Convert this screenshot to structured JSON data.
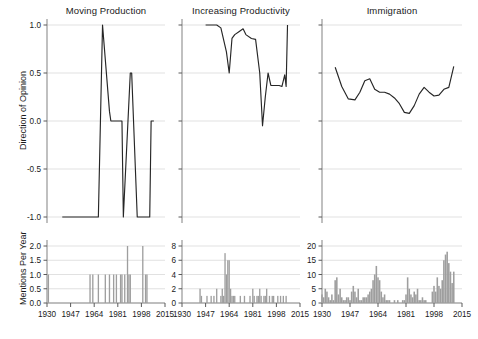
{
  "figure": {
    "panel_titles": [
      "Moving Production",
      "Increasing Productivity",
      "Immigration"
    ],
    "row_axis_labels": [
      "Direction of Opinion",
      "Mentions Per Year"
    ],
    "line_color": "#262626",
    "bar_color": "#9e9e9e",
    "grid_color": "#d9d9d9",
    "axis_color": "#8c8c8c"
  },
  "chart_data": [
    {
      "type": "line",
      "title": "Moving Production",
      "xlabel": "",
      "ylabel": "Direction of Opinion",
      "xlim": [
        1930,
        2015
      ],
      "ylim": [
        -1,
        1
      ],
      "yticks": [
        -1.0,
        -0.5,
        0.0,
        0.5,
        1.0
      ],
      "ytick_labels": [
        "-1.0",
        "-0.5",
        "0.0",
        "0.5",
        "1.0"
      ],
      "xticks": [
        1930,
        1947,
        1964,
        1981,
        1998,
        2015
      ],
      "xtick_labels": [
        "1930",
        "1947",
        "1964",
        "1981",
        "1998",
        "2015"
      ],
      "grid": true,
      "x": [
        1941,
        1950,
        1960,
        1966,
        1967,
        1970,
        1975,
        1976,
        1980,
        1983,
        1984,
        1985,
        1990,
        1991,
        1995,
        1999,
        2000,
        2004,
        2005,
        2007
      ],
      "y": [
        -1,
        -1,
        -1,
        -1,
        -1,
        1,
        0.1,
        0,
        0,
        0,
        0,
        -1,
        0.5,
        0.5,
        -1,
        -1,
        -1,
        -1,
        0,
        0
      ]
    },
    {
      "type": "line",
      "title": "Increasing Productivity",
      "xlabel": "",
      "ylabel": "Direction of Opinion",
      "xlim": [
        1930,
        2015
      ],
      "ylim": [
        -1,
        1
      ],
      "yticks": [
        -1.0,
        -0.5,
        0.0,
        0.5,
        1.0
      ],
      "ytick_labels": [
        "-1.0",
        "-0.5",
        "0.0",
        "0.5",
        "1.0"
      ],
      "xticks": [
        1930,
        1947,
        1964,
        1981,
        1998,
        2015
      ],
      "xtick_labels": [
        "1930",
        "1947",
        "1964",
        "1981",
        "1998",
        "2015"
      ],
      "grid": true,
      "x": [
        1947,
        1953,
        1955,
        1958,
        1962,
        1964,
        1966,
        1968,
        1971,
        1974,
        1976,
        1980,
        1983,
        1986,
        1988,
        1990,
        1992,
        1994,
        1997,
        2000,
        2002,
        2004,
        2005,
        2006
      ],
      "y": [
        1.0,
        1.0,
        1.0,
        0.97,
        0.72,
        0.5,
        0.86,
        0.9,
        0.93,
        0.96,
        0.9,
        0.86,
        0.85,
        0.5,
        -0.05,
        0.25,
        0.5,
        0.37,
        0.37,
        0.37,
        0.36,
        0.48,
        0.36,
        1.0
      ]
    },
    {
      "type": "line",
      "title": "Immigration",
      "xlabel": "",
      "ylabel": "Direction of Opinion",
      "xlim": [
        1930,
        2015
      ],
      "ylim": [
        -1,
        1
      ],
      "yticks": [
        -1.0,
        -0.5,
        0.0,
        0.5,
        1.0
      ],
      "ytick_labels": [
        "-1.0",
        "-0.5",
        "0.0",
        "0.5",
        "1.0"
      ],
      "xticks": [
        1930,
        1947,
        1964,
        1981,
        1998,
        2015
      ],
      "xtick_labels": [
        "1930",
        "1947",
        "1964",
        "1981",
        "1998",
        "2015"
      ],
      "grid": true,
      "x": [
        1938,
        1942,
        1946,
        1950,
        1953,
        1956,
        1959,
        1962,
        1965,
        1968,
        1971,
        1974,
        1977,
        1980,
        1983,
        1986,
        1989,
        1992,
        1995,
        1998,
        2001,
        2004,
        2007,
        2010
      ],
      "y": [
        0.56,
        0.36,
        0.23,
        0.22,
        0.3,
        0.42,
        0.44,
        0.33,
        0.3,
        0.3,
        0.28,
        0.24,
        0.18,
        0.09,
        0.08,
        0.16,
        0.28,
        0.35,
        0.3,
        0.26,
        0.27,
        0.33,
        0.35,
        0.57
      ]
    },
    {
      "type": "bar",
      "title": "",
      "xlabel": "",
      "ylabel": "Mentions Per Year",
      "xlim": [
        1930,
        2015
      ],
      "ylim": [
        0,
        2
      ],
      "yticks": [
        0.0,
        0.5,
        1.0,
        1.5,
        2.0
      ],
      "ytick_labels": [
        "0.0",
        "0.5",
        "1.0",
        "1.5",
        "2.0"
      ],
      "xticks": [
        1930,
        1947,
        1964,
        1981,
        1998,
        2015
      ],
      "xtick_labels": [
        "1930",
        "1947",
        "1964",
        "1981",
        "1998",
        "2015"
      ],
      "grid": true,
      "x": [
        1931,
        1961,
        1963,
        1967,
        1972,
        1975,
        1978,
        1980,
        1983,
        1984,
        1986,
        1988,
        1989,
        1990,
        1999,
        2001,
        2002
      ],
      "values": [
        1,
        1,
        1,
        1,
        1,
        1,
        1,
        1,
        1,
        1,
        1,
        2,
        1,
        1,
        2,
        1,
        1
      ]
    },
    {
      "type": "bar",
      "title": "",
      "xlabel": "",
      "ylabel": "Mentions Per Year",
      "xlim": [
        1930,
        2015
      ],
      "ylim": [
        0,
        8
      ],
      "yticks": [
        0,
        2,
        4,
        6,
        8
      ],
      "ytick_labels": [
        "0",
        "2",
        "4",
        "6",
        "8"
      ],
      "xticks": [
        1930,
        1947,
        1964,
        1981,
        1998,
        2015
      ],
      "xtick_labels": [
        "1930",
        "1947",
        "1964",
        "1981",
        "1998",
        "2015"
      ],
      "grid": true,
      "x": [
        1943,
        1944,
        1948,
        1951,
        1953,
        1955,
        1958,
        1959,
        1960,
        1961,
        1962,
        1963,
        1964,
        1965,
        1966,
        1967,
        1968,
        1972,
        1975,
        1979,
        1981,
        1982,
        1984,
        1985,
        1986,
        1987,
        1989,
        1990,
        1991,
        1993,
        1995,
        1996,
        1999,
        2001,
        2003,
        2005
      ],
      "values": [
        2,
        1,
        1,
        1,
        1,
        2,
        1,
        2,
        1,
        7,
        4,
        6,
        6,
        2,
        1,
        1,
        1,
        1,
        1,
        1,
        2,
        1,
        1,
        1,
        2,
        1,
        1,
        1,
        2,
        1,
        1,
        1,
        1,
        1,
        1,
        1
      ]
    },
    {
      "type": "bar",
      "title": "",
      "xlabel": "",
      "ylabel": "Mentions Per Year",
      "xlim": [
        1930,
        2015
      ],
      "ylim": [
        0,
        20
      ],
      "yticks": [
        0,
        5,
        10,
        15,
        20
      ],
      "ytick_labels": [
        "0",
        "5",
        "10",
        "15",
        "20"
      ],
      "xticks": [
        1930,
        1947,
        1964,
        1981,
        1998,
        2015
      ],
      "xtick_labels": [
        "1930",
        "1947",
        "1964",
        "1981",
        "1998",
        "2015"
      ],
      "grid": true,
      "x": [
        1930,
        1931,
        1932,
        1933,
        1934,
        1935,
        1936,
        1937,
        1938,
        1939,
        1940,
        1941,
        1942,
        1943,
        1944,
        1945,
        1946,
        1947,
        1948,
        1949,
        1950,
        1951,
        1952,
        1953,
        1954,
        1955,
        1956,
        1957,
        1958,
        1959,
        1960,
        1961,
        1962,
        1963,
        1964,
        1965,
        1966,
        1967,
        1968,
        1969,
        1970,
        1971,
        1972,
        1973,
        1974,
        1975,
        1976,
        1977,
        1978,
        1979,
        1980,
        1981,
        1982,
        1983,
        1984,
        1985,
        1986,
        1987,
        1988,
        1989,
        1990,
        1991,
        1992,
        1993,
        1994,
        1995,
        1996,
        1997,
        1998,
        1999,
        2000,
        2001,
        2002,
        2003,
        2004,
        2005,
        2006,
        2007,
        2008,
        2009,
        2010
      ],
      "values": [
        3,
        2,
        5,
        4,
        2,
        1,
        3,
        1,
        8,
        9,
        3,
        5,
        2,
        1,
        1,
        2,
        2,
        1,
        4,
        6,
        4,
        2,
        5,
        1,
        1,
        2,
        2,
        2,
        3,
        4,
        5,
        8,
        10,
        13,
        9,
        8,
        4,
        2,
        3,
        1,
        1,
        1,
        0,
        0,
        1,
        0,
        1,
        0,
        0,
        1,
        1,
        3,
        9,
        5,
        3,
        2,
        4,
        3,
        5,
        1,
        1,
        2,
        1,
        1,
        0,
        0,
        0,
        4,
        6,
        4,
        9,
        6,
        5,
        8,
        15,
        17,
        18,
        14,
        11,
        7,
        11
      ]
    }
  ]
}
